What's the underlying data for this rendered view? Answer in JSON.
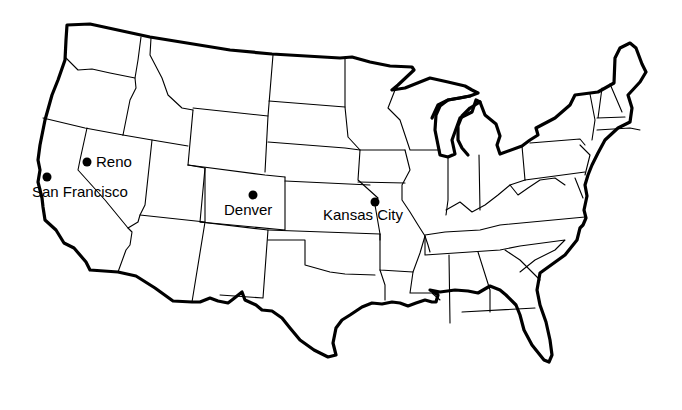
{
  "map": {
    "title": "United States",
    "colors": {
      "background": "#ffffff",
      "ink": "#000000"
    },
    "cities": [
      {
        "name": "Reno",
        "dot": [
          87,
          162
        ],
        "label": [
          96,
          167
        ]
      },
      {
        "name": "San Francisco",
        "dot": [
          47,
          177
        ],
        "label": [
          32,
          197
        ]
      },
      {
        "name": "Denver",
        "dot": [
          253,
          195
        ],
        "label": [
          224,
          215
        ]
      },
      {
        "name": "Kansas City",
        "dot": [
          375,
          202
        ],
        "label": [
          323,
          220
        ]
      }
    ]
  }
}
